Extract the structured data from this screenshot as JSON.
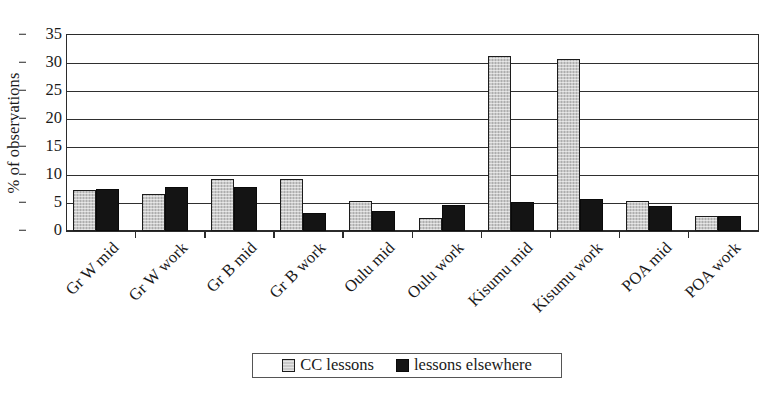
{
  "chart_data": {
    "type": "bar",
    "title": "",
    "subtitle": "",
    "xlabel": "",
    "ylabel": "% of observations",
    "ylim": [
      0,
      35
    ],
    "yticks": [
      0,
      5,
      10,
      15,
      20,
      25,
      30,
      35
    ],
    "grid": true,
    "grid_axis": "y",
    "legend_position": "bottom-center",
    "categories": [
      "Gr W mid",
      "Gr W work",
      "Gr B mid",
      "Gr B work",
      "Oulu mid",
      "Oulu work",
      "Kisumu mid",
      "Kisumu work",
      "POA mid",
      "POA work"
    ],
    "series": [
      {
        "name": "CC lessons",
        "color": "#c9c9c9",
        "values": [
          7.3,
          6.6,
          9.2,
          9.3,
          5.3,
          2.4,
          31.3,
          30.8,
          5.4,
          2.7
        ]
      },
      {
        "name": "lessons elsewhere",
        "color": "#141414",
        "values": [
          7.5,
          7.8,
          7.8,
          3.3,
          3.5,
          4.6,
          5.2,
          5.7,
          4.4,
          2.7
        ]
      }
    ]
  },
  "legend": {
    "entries": [
      {
        "label": "CC lessons",
        "swatch": "light"
      },
      {
        "label": "lessons elsewhere",
        "swatch": "dark"
      }
    ]
  },
  "colors": {
    "series_cc_lessons": "#c9c9c9",
    "series_lessons_elsewhere": "#141414",
    "axis": "#2b2b2b",
    "grid": "#2f2f2f",
    "background": "#ffffff"
  }
}
